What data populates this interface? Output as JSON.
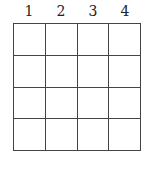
{
  "column_labels": [
    "1",
    "2",
    "3",
    "4"
  ],
  "grid": {
    "rows": 4,
    "columns": 4
  },
  "colors": {
    "line": "#444444",
    "text": "#222222",
    "background": "#ffffff"
  }
}
